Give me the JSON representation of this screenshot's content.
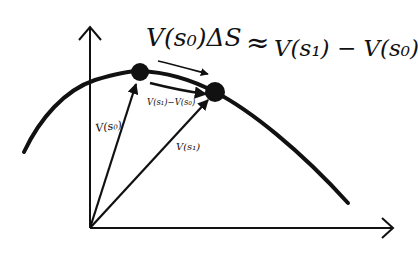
{
  "diagram": {
    "type": "hand-drawn sketch",
    "colors": {
      "ink": "#111111",
      "background": "#ffffff"
    },
    "equation": {
      "text": "V(s0)ΔS ≈ V(s1) − V(s0)",
      "lhs": "V(s₀)ΔS",
      "approx": "≈",
      "rhs": "V(s₁) − V(s₀)"
    },
    "axes": {
      "x": {
        "label": ""
      },
      "y": {
        "label": ""
      }
    },
    "points": [
      {
        "id": "s0",
        "label": "s₀"
      },
      {
        "id": "s1",
        "label": "s₁"
      }
    ],
    "vector_labels": {
      "v_s0": "V(s₀)",
      "v_s1": "V(s₁)",
      "difference": "V(s₁)−V(s₀)"
    }
  }
}
